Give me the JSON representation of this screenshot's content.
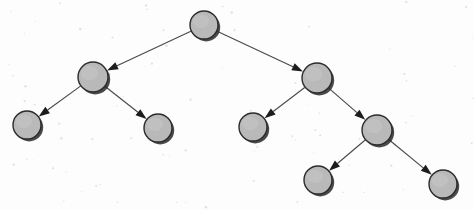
{
  "figure": {
    "type": "node-link-tree",
    "background_color": "#fdfdfd",
    "node_fill_color": "#b9b9b9",
    "node_stroke_color": "#2b2b2b",
    "edge_color": "#4a4a4a",
    "arrowhead_color": "#1c1c1c",
    "canvas": {
      "width": 474,
      "height": 210
    }
  },
  "chart_data": {
    "type": "diagram",
    "node_radius": 14,
    "nodes": [
      {
        "id": "n0",
        "label": "",
        "x": 204,
        "y": 25,
        "r": 14,
        "depth": 0,
        "role": "root"
      },
      {
        "id": "n1",
        "label": "",
        "x": 93,
        "y": 77,
        "r": 15,
        "depth": 1,
        "role": "internal"
      },
      {
        "id": "n2",
        "label": "",
        "x": 317,
        "y": 78,
        "r": 15,
        "depth": 1,
        "role": "internal"
      },
      {
        "id": "n3",
        "label": "",
        "x": 27,
        "y": 125,
        "r": 14,
        "depth": 2,
        "role": "leaf"
      },
      {
        "id": "n4",
        "label": "",
        "x": 158,
        "y": 128,
        "r": 14,
        "depth": 2,
        "role": "leaf"
      },
      {
        "id": "n5",
        "label": "",
        "x": 253,
        "y": 127,
        "r": 14,
        "depth": 2,
        "role": "leaf"
      },
      {
        "id": "n6",
        "label": "",
        "x": 377,
        "y": 130,
        "r": 15,
        "depth": 2,
        "role": "internal"
      },
      {
        "id": "n7",
        "label": "",
        "x": 318,
        "y": 180,
        "r": 14,
        "depth": 3,
        "role": "leaf"
      },
      {
        "id": "n8",
        "label": "",
        "x": 443,
        "y": 184,
        "r": 14,
        "depth": 3,
        "role": "leaf"
      }
    ],
    "edges": [
      {
        "from": "n0",
        "to": "n1",
        "directed": true
      },
      {
        "from": "n0",
        "to": "n2",
        "directed": true
      },
      {
        "from": "n1",
        "to": "n3",
        "directed": true
      },
      {
        "from": "n1",
        "to": "n4",
        "directed": true
      },
      {
        "from": "n2",
        "to": "n5",
        "directed": true
      },
      {
        "from": "n2",
        "to": "n6",
        "directed": true
      },
      {
        "from": "n6",
        "to": "n7",
        "directed": true
      },
      {
        "from": "n6",
        "to": "n8",
        "directed": true
      }
    ]
  }
}
